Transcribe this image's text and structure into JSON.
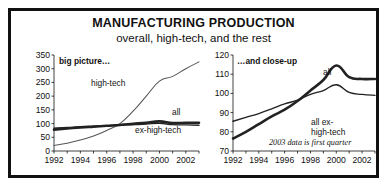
{
  "header": {
    "title": "MANUFACTURING PRODUCTION",
    "subtitle": "overall, high-tech, and the rest"
  },
  "panels": {
    "left_label": "big picture…",
    "right_label": "…and close-up"
  },
  "chart_data": [
    {
      "id": "big-picture",
      "type": "line",
      "title": "big picture…",
      "xlabel": "",
      "ylabel": "",
      "xlim": [
        1992,
        2003
      ],
      "ylim": [
        0,
        350
      ],
      "yticks": [
        0,
        50,
        100,
        150,
        200,
        250,
        300,
        350
      ],
      "xticks": [
        1992,
        1993,
        1994,
        1995,
        1996,
        1997,
        1998,
        1999,
        2000,
        2001,
        2002,
        2003
      ],
      "xticklabels": [
        "1992",
        "",
        "1994",
        "",
        "1996",
        "",
        "1998",
        "",
        "2000",
        "",
        "2002",
        ""
      ],
      "grid": false,
      "legend_position": "inline-annotations",
      "x": [
        1992,
        1993,
        1994,
        1995,
        1996,
        1997,
        1998,
        1999,
        2000,
        2001,
        2002,
        2003
      ],
      "series": [
        {
          "name": "high-tech",
          "label": "high-tech",
          "style": "thin",
          "values": [
            20,
            28,
            40,
            55,
            75,
            100,
            145,
            200,
            255,
            272,
            300,
            325
          ]
        },
        {
          "name": "all",
          "label": "all",
          "style": "thick",
          "values": [
            78,
            82,
            86,
            89,
            92,
            95,
            99,
            103,
            108,
            102,
            103,
            103
          ]
        },
        {
          "name": "ex-high-tech",
          "label": "ex-high-tech",
          "style": "mid",
          "values": [
            83,
            86,
            88,
            90,
            92,
            94,
            96,
            98,
            101,
            96,
            95,
            94
          ]
        }
      ]
    },
    {
      "id": "close-up",
      "type": "line",
      "title": "…and close-up",
      "xlabel": "",
      "ylabel": "",
      "xlim": [
        1992,
        2003
      ],
      "ylim": [
        70,
        120
      ],
      "yticks": [
        70,
        80,
        90,
        100,
        110,
        120
      ],
      "xticks": [
        1992,
        1993,
        1994,
        1995,
        1996,
        1997,
        1998,
        1999,
        2000,
        2001,
        2002,
        2003
      ],
      "xticklabels": [
        "1992",
        "",
        "1994",
        "",
        "1996",
        "",
        "1998",
        "",
        "2000",
        "",
        "2002",
        ""
      ],
      "grid": false,
      "legend_position": "inline-annotations",
      "annotation": "2003 data is first quarter",
      "x": [
        1992,
        1993,
        1994,
        1995,
        1996,
        1997,
        1998,
        1999,
        2000,
        2001,
        2002,
        2003
      ],
      "series": [
        {
          "name": "all",
          "label": "all",
          "style": "thick",
          "values": [
            76.5,
            80,
            84,
            88,
            91.5,
            96,
            101.5,
            107,
            114.5,
            108.5,
            107.5,
            107.5
          ]
        },
        {
          "name": "all-ex-high-tech",
          "label": "all ex-\nhigh-tech",
          "label_line1": "all ex-",
          "label_line2": "high-tech",
          "style": "mid",
          "values": [
            85.5,
            87.5,
            89.5,
            92,
            94.5,
            96.5,
            99.5,
            101.5,
            104.5,
            100.5,
            99.5,
            99
          ]
        }
      ]
    }
  ]
}
